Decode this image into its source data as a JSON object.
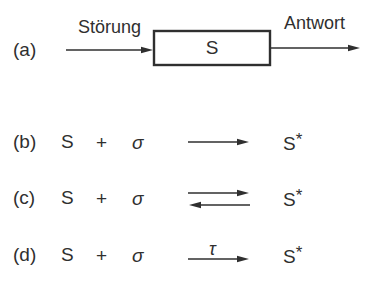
{
  "figure": {
    "panel_a": {
      "label": "(a)",
      "stimulus": "Störung",
      "system": "S",
      "response": "Antwort"
    },
    "panel_b": {
      "label": "(b)",
      "reactant": "S",
      "operator": "+",
      "stimulus_symbol": "σ",
      "product_base": "S",
      "product_superscript": "*"
    },
    "panel_c": {
      "label": "(c)",
      "reactant": "S",
      "operator": "+",
      "stimulus_symbol": "σ",
      "product_base": "S",
      "product_superscript": "*"
    },
    "panel_d": {
      "label": "(d)",
      "reactant": "S",
      "operator": "+",
      "stimulus_symbol": "σ",
      "arrow_label": "τ",
      "product_base": "S",
      "product_superscript": "*"
    },
    "colors": {
      "ink": "#2f2f2f",
      "background": "#ffffff"
    }
  }
}
